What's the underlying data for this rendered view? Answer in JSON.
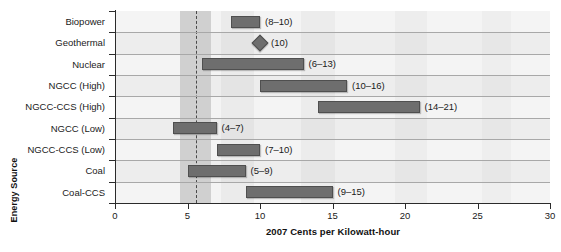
{
  "chart_data": {
    "type": "bar",
    "subtype": "horizontal-range-bar",
    "title": "",
    "xlabel": "2007 Cents per Kilowatt-hour",
    "ylabel": "Energy Source",
    "xlim": [
      0,
      30
    ],
    "xticks": [
      0,
      5,
      10,
      15,
      20,
      25,
      30
    ],
    "xtick_labels": [
      "0",
      "5",
      "10",
      "15",
      "20",
      "25",
      "30"
    ],
    "grid": true,
    "legend": "none",
    "categories": [
      "Biopower",
      "Geothermal",
      "Nuclear",
      "NGCC (High)",
      "NGCC-CCS (High)",
      "NGCC (Low)",
      "NGCC-CCS (Low)",
      "Coal",
      "Coal-CCS"
    ],
    "ranges": [
      {
        "category": "Biopower",
        "low": 8,
        "high": 10,
        "label": "(8–10)",
        "marker": "bar"
      },
      {
        "category": "Geothermal",
        "low": 10,
        "high": 10,
        "label": "(10)",
        "marker": "diamond"
      },
      {
        "category": "Nuclear",
        "low": 6,
        "high": 13,
        "label": "(6–13)",
        "marker": "bar"
      },
      {
        "category": "NGCC (High)",
        "low": 10,
        "high": 16,
        "label": "(10–16)",
        "marker": "bar"
      },
      {
        "category": "NGCC-CCS (High)",
        "low": 14,
        "high": 21,
        "label": "(14–21)",
        "marker": "bar"
      },
      {
        "category": "NGCC (Low)",
        "low": 4,
        "high": 7,
        "label": "(4–7)",
        "marker": "bar"
      },
      {
        "category": "NGCC-CCS (Low)",
        "low": 7,
        "high": 10,
        "label": "(7–10)",
        "marker": "bar"
      },
      {
        "category": "Coal",
        "low": 5,
        "high": 9,
        "label": "(5–9)",
        "marker": "bar"
      },
      {
        "category": "Coal-CCS",
        "low": 9,
        "high": 15,
        "label": "(9–15)",
        "marker": "bar"
      }
    ],
    "reference_band": {
      "low": 4.5,
      "high": 6.6,
      "dashed_value": 5.6
    },
    "colors": {
      "bar_fill": "#6e6e6e",
      "bar_edge": "#4f4f4f",
      "plot_background": "#f2f2f2",
      "band_fill": "#c9c9c9",
      "gridline": "#a8a8a8",
      "axis": "#2b2b2b",
      "text": "#1a1a1a"
    }
  }
}
